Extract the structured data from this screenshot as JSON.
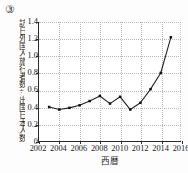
{
  "item_number": "③",
  "chart_data": {
    "type": "line",
    "title": "",
    "xlabel": "西暦",
    "ylabel": "訪日外国人旅行者数÷出国日本人数",
    "x": [
      2003,
      2004,
      2005,
      2006,
      2007,
      2008,
      2009,
      2010,
      2011,
      2012,
      2013,
      2014,
      2015
    ],
    "values": [
      0.4,
      0.37,
      0.39,
      0.42,
      0.47,
      0.53,
      0.44,
      0.52,
      0.37,
      0.45,
      0.61,
      0.8,
      1.22
    ],
    "series": [
      {
        "name": "訪日外国人旅行者数÷出国日本人数",
        "values": [
          0.4,
          0.37,
          0.39,
          0.42,
          0.47,
          0.53,
          0.44,
          0.52,
          0.37,
          0.45,
          0.61,
          0.8,
          1.22
        ]
      }
    ],
    "xlim": [
      2002,
      2016
    ],
    "ylim": [
      0,
      1.4
    ],
    "xticks": [
      2002,
      2004,
      2006,
      2008,
      2010,
      2012,
      2014,
      2016
    ],
    "xtick_labels": [
      "2002",
      "2004",
      "2006",
      "2008",
      "2010",
      "2012",
      "2014",
      "2016"
    ],
    "yticks": [
      0,
      0.2,
      0.4,
      0.6,
      0.8,
      1.0,
      1.2,
      1.4
    ],
    "ytick_labels": [
      "0",
      "0.2",
      "0.4",
      "0.6",
      "0.8",
      "1.0",
      "1.2",
      "1.4"
    ],
    "grid": true,
    "grid_style": "dotted",
    "legend": false,
    "legend_position": "none",
    "marker": "square",
    "line_color": "#222222",
    "marker_color": "#111111",
    "grid_color": "#b9b9b9",
    "axis_color": "#2b2b2b"
  }
}
